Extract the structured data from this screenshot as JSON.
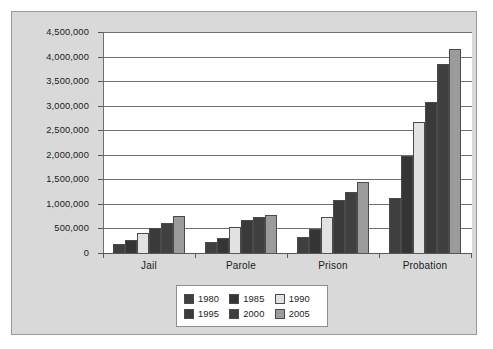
{
  "chart_data": {
    "type": "bar",
    "title": "",
    "subtitle": "",
    "xlabel": "",
    "ylabel": "",
    "categories": [
      "Jail",
      "Parole",
      "Prison",
      "Probation"
    ],
    "series": [
      {
        "name": "1980",
        "color": "#3f3f3f",
        "values": [
          180000,
          220000,
          320000,
          1120000
        ]
      },
      {
        "name": "1985",
        "color": "#353535",
        "values": [
          255000,
          300000,
          480000,
          1970000
        ]
      },
      {
        "name": "1990",
        "color": "#e2e2e2",
        "values": [
          405000,
          531000,
          740000,
          2670000
        ]
      },
      {
        "name": "1995",
        "color": "#3a3a3a",
        "values": [
          510000,
          679000,
          1080000,
          3080000
        ]
      },
      {
        "name": "2000",
        "color": "#404040",
        "values": [
          620000,
          724000,
          1250000,
          3840000
        ]
      },
      {
        "name": "2005",
        "color": "#9b9b9b",
        "values": [
          747000,
          784000,
          1450000,
          4160000
        ]
      }
    ],
    "ylim": [
      0,
      4500000
    ],
    "ytick_step": 500000,
    "ytick_labels": [
      "4,500,000",
      "4,000,000",
      "3,500,000",
      "3,000,000",
      "2,500,000",
      "2,000,000",
      "1,500,000",
      "1,000,000",
      "500,000",
      "0"
    ],
    "ytick_values": [
      4500000,
      4000000,
      3500000,
      3000000,
      2500000,
      2000000,
      1500000,
      1000000,
      500000,
      0
    ],
    "grid": true,
    "grid_axis": "y",
    "legend_position": "bottom-center",
    "legend_layout": "2 rows x 3 columns",
    "legend_entries": [
      "1980",
      "1985",
      "1990",
      "1995",
      "2000",
      "2005"
    ]
  },
  "figure": {
    "background_color": "#d9d9d9",
    "plot_background_color": "#ffffff",
    "border_color": "#9a9a9a"
  }
}
